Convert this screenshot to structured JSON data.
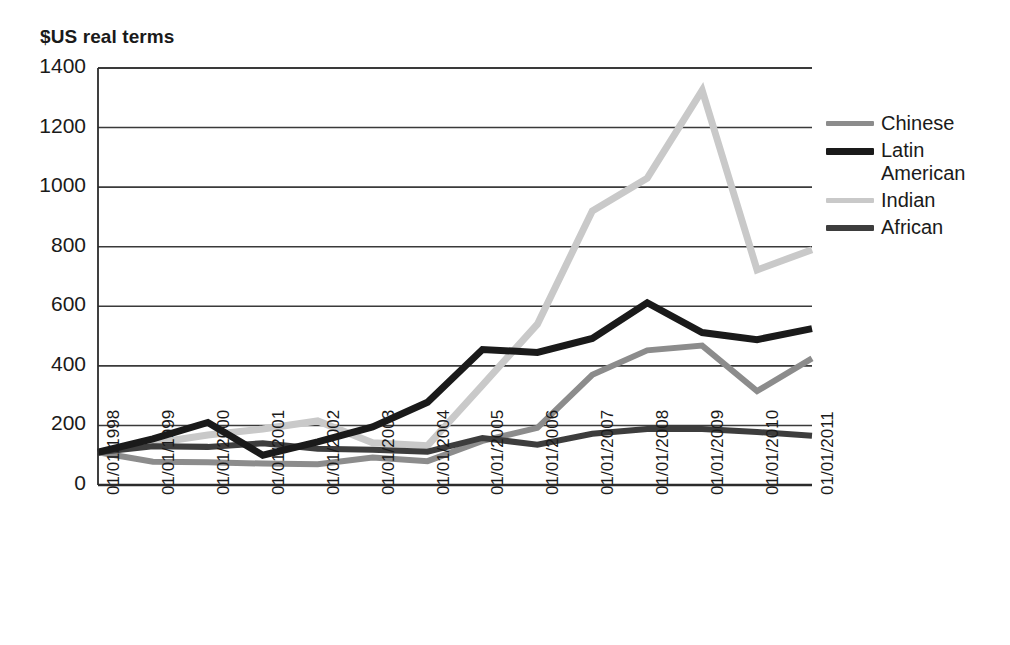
{
  "chart_data": {
    "type": "line",
    "title": "$US real terms",
    "xlabel": "",
    "ylabel": "$US real terms",
    "ylim": [
      0,
      1400
    ],
    "ytick_step": 200,
    "yticks": [
      0,
      200,
      400,
      600,
      800,
      1000,
      1200,
      1400
    ],
    "grid": true,
    "grid_axis": "y",
    "legend_position": "right",
    "categories": [
      "01/01/1998",
      "01/01/1999",
      "01/01/2000",
      "01/01/2001",
      "01/01/2002",
      "01/01/2003",
      "01/01/2004",
      "01/01/2005",
      "01/01/2006",
      "01/01/2007",
      "01/01/2008",
      "01/01/2009",
      "01/01/2010",
      "01/01/2011"
    ],
    "series": [
      {
        "name": "Chinese",
        "color": "#8c8c8c",
        "width": 6,
        "values": [
          110,
          78,
          76,
          72,
          70,
          92,
          80,
          148,
          192,
          370,
          452,
          468,
          315,
          425
        ]
      },
      {
        "name": "Latin\nAmerican",
        "color": "#1a1a1a",
        "width": 7,
        "values": [
          110,
          155,
          210,
          100,
          145,
          195,
          278,
          455,
          445,
          492,
          612,
          512,
          488,
          525
        ]
      },
      {
        "name": "Indian",
        "color": "#c9c9c9",
        "width": 7,
        "values": [
          110,
          140,
          168,
          188,
          215,
          142,
          132,
          335,
          540,
          920,
          1030,
          1325,
          722,
          790
        ]
      },
      {
        "name": "African",
        "color": "#3d3d3d",
        "width": 6,
        "values": [
          110,
          130,
          128,
          140,
          122,
          118,
          112,
          158,
          135,
          172,
          188,
          188,
          178,
          165
        ]
      }
    ]
  },
  "legend": {
    "items": [
      {
        "label": "Chinese",
        "color": "#8c8c8c",
        "thickness": 5
      },
      {
        "label": "Latin\nAmerican",
        "color": "#1a1a1a",
        "thickness": 7
      },
      {
        "label": "Indian",
        "color": "#c9c9c9",
        "thickness": 5
      },
      {
        "label": "African",
        "color": "#3d3d3d",
        "thickness": 6
      }
    ]
  },
  "axes": {
    "y_axis_color": "#2b2b2b",
    "x_axis_color": "#2b2b2b",
    "grid_color": "#3a3a3a"
  }
}
